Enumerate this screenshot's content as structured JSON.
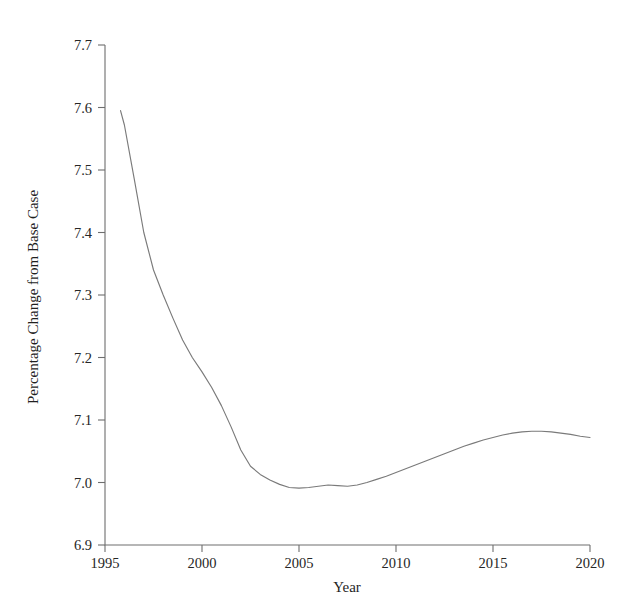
{
  "chart_data": {
    "type": "line",
    "title": "",
    "subtitle": "",
    "xlabel": "Year",
    "ylabel": "Percentage Change from Base Case",
    "xlim": [
      1995,
      2020
    ],
    "ylim": [
      6.9,
      7.7
    ],
    "xticks": [
      1995,
      2000,
      2005,
      2010,
      2015,
      2020
    ],
    "xtick_labels": [
      "1995",
      "2000",
      "2005",
      "2010",
      "2015",
      "2020"
    ],
    "yticks": [
      6.9,
      7.0,
      7.1,
      7.2,
      7.3,
      7.4,
      7.5,
      7.6,
      7.7
    ],
    "ytick_labels": [
      "6.9",
      "7.0",
      "7.1",
      "7.2",
      "7.3",
      "7.4",
      "7.5",
      "7.6",
      "7.7"
    ],
    "grid": false,
    "legend": false,
    "legend_position": "none",
    "line_color": "#7a7a7a",
    "series": [
      {
        "name": "Percentage Change from Base Case",
        "x": [
          1995.8,
          1996.0,
          1996.5,
          1997.0,
          1997.5,
          1998.0,
          1998.5,
          1999.0,
          1999.5,
          2000.0,
          2000.5,
          2001.0,
          2001.5,
          2002.0,
          2002.5,
          2003.0,
          2003.5,
          2004.0,
          2004.5,
          2005.0,
          2005.5,
          2006.0,
          2006.5,
          2007.0,
          2007.5,
          2008.0,
          2008.5,
          2009.0,
          2009.5,
          2010.0,
          2010.5,
          2011.0,
          2011.5,
          2012.0,
          2012.5,
          2013.0,
          2013.5,
          2014.0,
          2014.5,
          2015.0,
          2015.5,
          2016.0,
          2016.5,
          2017.0,
          2017.5,
          2018.0,
          2018.5,
          2019.0,
          2019.5,
          2020.0
        ],
        "y": [
          7.595,
          7.572,
          7.487,
          7.4,
          7.34,
          7.3,
          7.263,
          7.228,
          7.2,
          7.177,
          7.152,
          7.123,
          7.089,
          7.052,
          7.026,
          7.013,
          7.004,
          6.997,
          6.992,
          6.991,
          6.992,
          6.994,
          6.996,
          6.995,
          6.994,
          6.996,
          7.0,
          7.005,
          7.01,
          7.016,
          7.022,
          7.028,
          7.034,
          7.04,
          7.046,
          7.052,
          7.058,
          7.063,
          7.068,
          7.072,
          7.076,
          7.079,
          7.081,
          7.082,
          7.082,
          7.081,
          7.079,
          7.077,
          7.074,
          7.072
        ]
      }
    ],
    "annotations": [],
    "notable_points": {
      "start": {
        "x": 1995.8,
        "y": 7.595
      },
      "minimum": {
        "x": 2005.0,
        "y": 6.991
      },
      "local_dip": {
        "x": 2007.5,
        "y": 6.994
      },
      "peak": {
        "x": 2017.2,
        "y": 7.082
      },
      "end": {
        "x": 2020.0,
        "y": 7.072
      }
    }
  }
}
